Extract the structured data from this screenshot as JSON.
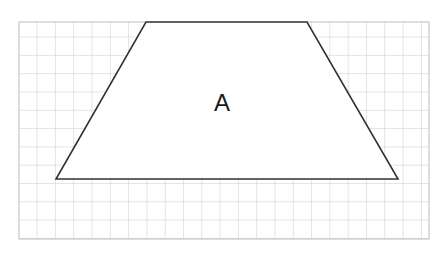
{
  "figure": {
    "canvas": {
      "width": 435,
      "height": 264,
      "background": "#ffffff"
    },
    "grid": {
      "x": 19,
      "y": 22,
      "width": 410,
      "height": 217,
      "cell_size": 18.3,
      "line_color": "#c9c9c9",
      "line_width": 1,
      "border_color": "#bdbdbd",
      "columns": 22,
      "rows": 12,
      "visible": true
    },
    "shape": {
      "name": "trapezoid",
      "label": "A",
      "label_x": 222,
      "label_y": 105,
      "fill": "#ffffff",
      "stroke": "#333333",
      "stroke_width": 1.6,
      "points": "146,22 307,22 398,179 56,179",
      "vertices": [
        {
          "name": "top-left",
          "x": 146,
          "y": 22
        },
        {
          "name": "top-right",
          "x": 307,
          "y": 22
        },
        {
          "name": "bottom-right",
          "x": 398,
          "y": 179
        },
        {
          "name": "bottom-left",
          "x": 56,
          "y": 179
        }
      ]
    }
  }
}
